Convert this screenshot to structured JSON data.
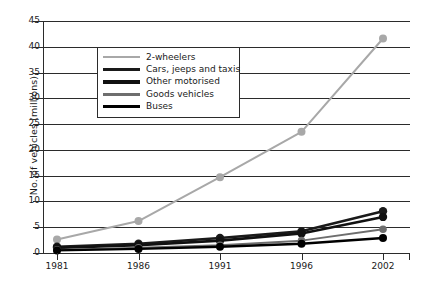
{
  "chart_data": {
    "type": "line",
    "title": "",
    "xlabel": "",
    "ylabel": "No. of vehicles (millions)",
    "categories": [
      "1981",
      "1986",
      "1991",
      "1996",
      "2002"
    ],
    "ylim": [
      0,
      45
    ],
    "ytick_step": 5,
    "yticks": [
      "45",
      "40",
      "35",
      "30",
      "25",
      "20",
      "15",
      "10",
      "5",
      "0"
    ],
    "grid": true,
    "grid_axis": "y",
    "legend_position": "upper-left-inside",
    "markers": "filled-circle",
    "series": [
      {
        "name": "2-wheelers",
        "color": "#a8a8a8",
        "values": [
          2.6,
          6.2,
          14.7,
          23.5,
          41.6
        ]
      },
      {
        "name": "Cars, jeeps and taxis",
        "color": "#1a1a1a",
        "values": [
          1.2,
          1.8,
          2.9,
          4.2,
          8.1
        ]
      },
      {
        "name": "Other motorised",
        "color": "#111111",
        "values": [
          1.0,
          1.5,
          2.4,
          3.8,
          7.0
        ]
      },
      {
        "name": "Goods vehicles",
        "color": "#6e6e6e",
        "values": [
          0.6,
          1.0,
          1.5,
          2.4,
          4.6
        ]
      },
      {
        "name": "Buses",
        "color": "#000000",
        "values": [
          0.5,
          0.8,
          1.2,
          1.8,
          2.9
        ]
      }
    ]
  },
  "legend": {
    "items": [
      {
        "label": "2-wheelers"
      },
      {
        "label": "Cars, jeeps and taxis"
      },
      {
        "label": "Other motorised"
      },
      {
        "label": "Goods vehicles"
      },
      {
        "label": "Buses"
      }
    ]
  }
}
